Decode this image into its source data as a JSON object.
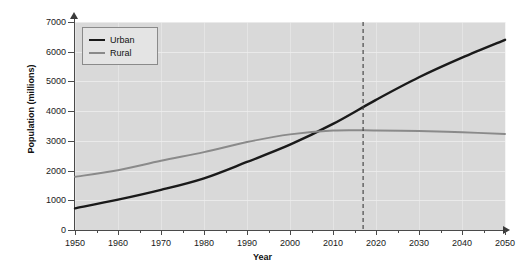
{
  "chart_data": {
    "type": "line",
    "title": "",
    "xlabel": "Year",
    "ylabel": "Population (millions)",
    "xlim": [
      1950,
      2050
    ],
    "ylim": [
      0,
      7000
    ],
    "xticks": [
      1950,
      1960,
      1970,
      1980,
      1990,
      2000,
      2010,
      2020,
      2030,
      2040,
      2050
    ],
    "xticks_minor": [
      1955,
      1965,
      1975,
      1985,
      1995,
      2005,
      2015,
      2025,
      2035,
      2045
    ],
    "yticks": [
      0,
      1000,
      2000,
      3000,
      4000,
      5000,
      6000,
      7000
    ],
    "grid": true,
    "legend_position": "upper left",
    "x": [
      1950,
      1960,
      1970,
      1980,
      1990,
      2000,
      2010,
      2020,
      2030,
      2040,
      2050
    ],
    "series": [
      {
        "name": "Urban",
        "color": "#1a1a1a",
        "values": [
          730,
          1020,
          1350,
          1740,
          2290,
          2870,
          3570,
          4380,
          5140,
          5800,
          6400
        ]
      },
      {
        "name": "Rural",
        "color": "#8a8a8a",
        "values": [
          1790,
          2010,
          2330,
          2620,
          2960,
          3220,
          3350,
          3350,
          3330,
          3290,
          3230
        ]
      }
    ],
    "annotations": [
      {
        "type": "vertical-line",
        "name": "present-year-marker",
        "x": 2017,
        "style": "dashed",
        "color": "#3d3d3d"
      }
    ],
    "crossover": {
      "year": 2007,
      "value": 3300
    },
    "panel_background": "#d9d9d9",
    "figure_background": "#ffffff",
    "gridline_color": "#ececec",
    "axis_color": "#4a4a4a"
  },
  "legend": {
    "items": [
      {
        "label": "Urban",
        "color": "#1a1a1a"
      },
      {
        "label": "Rural",
        "color": "#8a8a8a"
      }
    ]
  },
  "axis_labels": {
    "y": [
      "7000",
      "6000",
      "5000",
      "4000",
      "3000",
      "2000",
      "1000",
      "0"
    ],
    "x": [
      "1950",
      "1960",
      "1970",
      "1980",
      "1990",
      "2000",
      "2010",
      "2020",
      "2030",
      "2040",
      "2050"
    ]
  }
}
